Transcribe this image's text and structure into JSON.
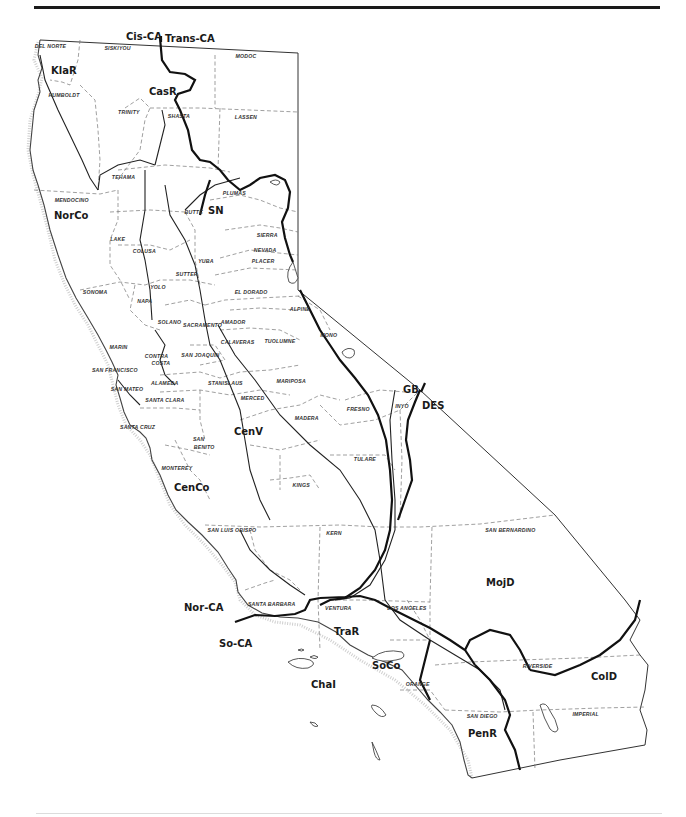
{
  "map": {
    "subject": "California floristic provinces and regions with county boundaries",
    "province_divide": {
      "left": "Cis-CA",
      "right": "Trans-CA"
    },
    "regions": [
      {
        "code": "KlaR",
        "x": 65,
        "y": 72
      },
      {
        "code": "CasR",
        "x": 163,
        "y": 93
      },
      {
        "code": "NorCo",
        "x": 68,
        "y": 217
      },
      {
        "code": "SN",
        "x": 222,
        "y": 212
      },
      {
        "code": "CenV",
        "x": 248,
        "y": 433
      },
      {
        "code": "CenCo",
        "x": 188,
        "y": 489
      },
      {
        "code": "GB",
        "x": 417,
        "y": 391
      },
      {
        "code": "DES",
        "x": 436,
        "y": 407
      },
      {
        "code": "MojD",
        "x": 500,
        "y": 584
      },
      {
        "code": "Nor-CA",
        "x": 198,
        "y": 609
      },
      {
        "code": "So-CA",
        "x": 233,
        "y": 645
      },
      {
        "code": "TraR",
        "x": 348,
        "y": 633
      },
      {
        "code": "SoCo",
        "x": 386,
        "y": 667
      },
      {
        "code": "ChaI",
        "x": 325,
        "y": 686
      },
      {
        "code": "ColD",
        "x": 605,
        "y": 678
      },
      {
        "code": "PenR",
        "x": 482,
        "y": 735
      }
    ],
    "counties": [
      {
        "name": "DEL NORTE",
        "x": 50,
        "y": 46
      },
      {
        "name": "SISKIYOU",
        "x": 118,
        "y": 48
      },
      {
        "name": "MODOC",
        "x": 244,
        "y": 56
      },
      {
        "name": "HUMBOLDT",
        "x": 62,
        "y": 95
      },
      {
        "name": "TRINITY",
        "x": 130,
        "y": 112
      },
      {
        "name": "SHASTA",
        "x": 178,
        "y": 116
      },
      {
        "name": "LASSEN",
        "x": 245,
        "y": 117
      },
      {
        "name": "TEHAMA",
        "x": 122,
        "y": 177
      },
      {
        "name": "PLUMAS",
        "x": 233,
        "y": 193
      },
      {
        "name": "MENDOCINO",
        "x": 70,
        "y": 200
      },
      {
        "name": "BUTTE",
        "x": 193,
        "y": 212
      },
      {
        "name": "SIERRA",
        "x": 267,
        "y": 235
      },
      {
        "name": "LAKE",
        "x": 117,
        "y": 239
      },
      {
        "name": "NEVADA",
        "x": 264,
        "y": 250
      },
      {
        "name": "COLUSA",
        "x": 143,
        "y": 251
      },
      {
        "name": "YUBA",
        "x": 205,
        "y": 261
      },
      {
        "name": "PLACER",
        "x": 262,
        "y": 261
      },
      {
        "name": "SUTTER",
        "x": 186,
        "y": 274
      },
      {
        "name": "YOLO",
        "x": 157,
        "y": 287
      },
      {
        "name": "SONOMA",
        "x": 93,
        "y": 292
      },
      {
        "name": "EL DORADO",
        "x": 250,
        "y": 292
      },
      {
        "name": "NAPA",
        "x": 144,
        "y": 301
      },
      {
        "name": "ALPINE",
        "x": 300,
        "y": 309
      },
      {
        "name": "SOLANO",
        "x": 168,
        "y": 322
      },
      {
        "name": "SACRAMENTO",
        "x": 200,
        "y": 325
      },
      {
        "name": "AMADOR",
        "x": 231,
        "y": 322
      },
      {
        "name": "MONO",
        "x": 327,
        "y": 335
      },
      {
        "name": "MARIN",
        "x": 118,
        "y": 347
      },
      {
        "name": "CALAVERAS",
        "x": 236,
        "y": 342
      },
      {
        "name": "TUOLUMNE",
        "x": 278,
        "y": 341
      },
      {
        "name": "CONTRA",
        "x": 155,
        "y": 356
      },
      {
        "name": "COSTA",
        "x": 160,
        "y": 363
      },
      {
        "name": "SAN JOAQUIN",
        "x": 200,
        "y": 355
      },
      {
        "name": "SAN FRANCISCO",
        "x": 114,
        "y": 370
      },
      {
        "name": "ALAMEDA",
        "x": 163,
        "y": 383
      },
      {
        "name": "STANISLAUS",
        "x": 225,
        "y": 383
      },
      {
        "name": "MARIPOSA",
        "x": 290,
        "y": 381
      },
      {
        "name": "SAN MATEO",
        "x": 126,
        "y": 389
      },
      {
        "name": "SANTA CLARA",
        "x": 164,
        "y": 400
      },
      {
        "name": "MERCED",
        "x": 251,
        "y": 398
      },
      {
        "name": "MADERA",
        "x": 305,
        "y": 418
      },
      {
        "name": "FRESNO",
        "x": 357,
        "y": 409
      },
      {
        "name": "INYO",
        "x": 402,
        "y": 406
      },
      {
        "name": "SANTA CRUZ",
        "x": 137,
        "y": 427
      },
      {
        "name": "SAN",
        "x": 198,
        "y": 439
      },
      {
        "name": "BENITO",
        "x": 204,
        "y": 447
      },
      {
        "name": "MONTEREY",
        "x": 175,
        "y": 468
      },
      {
        "name": "TULARE",
        "x": 364,
        "y": 459
      },
      {
        "name": "KINGS",
        "x": 301,
        "y": 485
      },
      {
        "name": "SAN LUIS OBISPO",
        "x": 233,
        "y": 530
      },
      {
        "name": "KERN",
        "x": 333,
        "y": 533
      },
      {
        "name": "SAN BERNARDINO",
        "x": 509,
        "y": 530
      },
      {
        "name": "SANTA BARBARA",
        "x": 270,
        "y": 604
      },
      {
        "name": "VENTURA",
        "x": 337,
        "y": 608
      },
      {
        "name": "LOS ANGELES",
        "x": 406,
        "y": 608
      },
      {
        "name": "RIVERSIDE",
        "x": 538,
        "y": 666
      },
      {
        "name": "ORANGE",
        "x": 416,
        "y": 684
      },
      {
        "name": "SAN DIEGO",
        "x": 482,
        "y": 716
      },
      {
        "name": "IMPERIAL",
        "x": 586,
        "y": 714
      }
    ]
  }
}
